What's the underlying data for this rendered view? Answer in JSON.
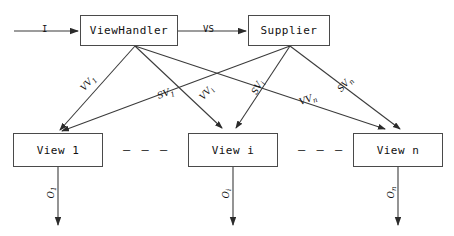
{
  "diagram": {
    "stroke_color": "#3b3b3b",
    "box_border_color": "#4a4a4a",
    "background": "#ffffff",
    "nodes": [
      {
        "id": "viewhandler",
        "label": "ViewHandler"
      },
      {
        "id": "supplier",
        "label": "Supplier"
      },
      {
        "id": "view1",
        "label": "View 1"
      },
      {
        "id": "viewi",
        "label": "View i"
      },
      {
        "id": "viewn",
        "label": "View n"
      }
    ],
    "edge_labels": {
      "input": "I",
      "vs": "VS",
      "vv1_base": "VV",
      "vv1_sub": "1",
      "vvi_base": "VV",
      "vvi_sub": "i",
      "vvn_base": "VV",
      "vvn_sub": "n",
      "sv1_base": "SV",
      "sv1_sub": "1",
      "svi_base": "SV",
      "svi_sub": "i",
      "svn_base": "SV",
      "svn_sub": "n",
      "o1_base": "O",
      "o1_sub": "1",
      "oi_base": "O",
      "oi_sub": "i",
      "on_base": "O",
      "on_sub": "n"
    },
    "separators": {
      "left": "– – –",
      "right": "– – –"
    }
  }
}
